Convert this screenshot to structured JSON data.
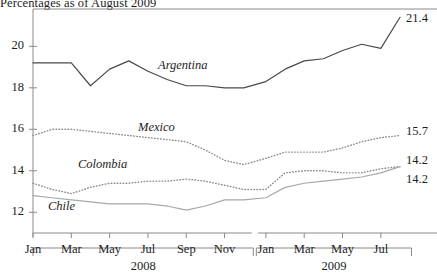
{
  "title": "Percentages as of August 2009",
  "axes": {
    "y_ticks": [
      "12",
      "14",
      "16",
      "18",
      "20"
    ],
    "x_ticks_2008": [
      "Jan",
      "Mar",
      "May",
      "Jul",
      "Sep",
      "Nov"
    ],
    "x_ticks_2009": [
      "Jan",
      "Mar",
      "May",
      "Jul"
    ],
    "year_2008": "2008",
    "year_2009": "2009"
  },
  "series_labels": {
    "argentina": "Argentina",
    "mexico": "Mexico",
    "colombia": "Colombia",
    "chile": "Chile"
  },
  "end_labels": {
    "argentina": "21.4",
    "mexico": "15.7",
    "colombia": "14.2",
    "chile": "14.2"
  },
  "colors": {
    "argentina": "#4a4a4a",
    "mexico": "#8c8c8c",
    "colombia": "#8c8c8c",
    "chile": "#a8a8a8",
    "axis": "#8a8a8a"
  },
  "chart_data": {
    "type": "line",
    "title": "Percentages as of August 2009",
    "xlabel": "",
    "ylabel": "",
    "ylim": [
      11.0,
      21.8
    ],
    "grid": false,
    "legend": "inline-series-labels",
    "x": [
      "2008-01",
      "2008-02",
      "2008-03",
      "2008-04",
      "2008-05",
      "2008-06",
      "2008-07",
      "2008-08",
      "2008-09",
      "2008-10",
      "2008-11",
      "2008-12",
      "2009-01",
      "2009-02",
      "2009-03",
      "2009-04",
      "2009-05",
      "2009-06",
      "2009-07",
      "2009-08"
    ],
    "x_tick_labels": [
      "Jan",
      "Mar",
      "May",
      "Jul",
      "Sep",
      "Nov",
      "Jan",
      "Mar",
      "May",
      "Jul"
    ],
    "series": [
      {
        "name": "Argentina",
        "style": "solid",
        "color": "#4a4a4a",
        "end_value": 21.4,
        "values": [
          19.2,
          19.2,
          19.2,
          18.1,
          18.9,
          19.3,
          18.8,
          18.4,
          18.1,
          18.1,
          18.0,
          18.0,
          18.3,
          18.9,
          19.3,
          19.4,
          19.8,
          20.1,
          19.9,
          21.4
        ]
      },
      {
        "name": "Mexico",
        "style": "dotted",
        "color": "#8c8c8c",
        "end_value": 15.7,
        "values": [
          15.7,
          16.0,
          16.0,
          15.9,
          15.8,
          15.7,
          15.6,
          15.5,
          15.4,
          15.0,
          14.5,
          14.3,
          14.6,
          14.9,
          14.9,
          14.9,
          15.1,
          15.4,
          15.6,
          15.7
        ]
      },
      {
        "name": "Colombia",
        "style": "dotted",
        "color": "#8c8c8c",
        "end_value": 14.2,
        "values": [
          13.4,
          13.1,
          12.9,
          13.2,
          13.4,
          13.4,
          13.5,
          13.5,
          13.6,
          13.5,
          13.3,
          13.1,
          13.1,
          13.9,
          14.0,
          14.0,
          13.9,
          13.9,
          14.1,
          14.2
        ]
      },
      {
        "name": "Chile",
        "style": "solid",
        "color": "#a8a8a8",
        "end_value": 14.2,
        "values": [
          12.8,
          12.7,
          12.6,
          12.5,
          12.4,
          12.4,
          12.4,
          12.3,
          12.1,
          12.3,
          12.6,
          12.6,
          12.7,
          13.2,
          13.4,
          13.5,
          13.6,
          13.7,
          13.9,
          14.2
        ]
      }
    ]
  }
}
